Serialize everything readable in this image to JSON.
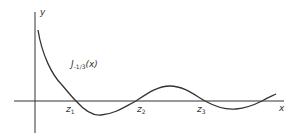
{
  "diagram": {
    "axes": {
      "x_label": "x",
      "y_label": "y"
    },
    "curve_label": {
      "name": "J",
      "subscript": "-1/3",
      "argument": "(x)"
    },
    "zeros": [
      {
        "name": "z",
        "subscript": "1"
      },
      {
        "name": "z",
        "subscript": "2"
      },
      {
        "name": "z",
        "subscript": "3"
      }
    ],
    "colors": {
      "line": "#333333",
      "background": "#ffffff"
    }
  }
}
